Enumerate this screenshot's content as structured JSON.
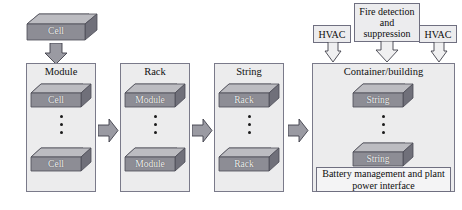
{
  "diagram": {
    "colors": {
      "panel_fill": "#ececed",
      "panel_stroke": "#7a7a8a",
      "block_top": "#b9b9bd",
      "block_front": "#8b8b93",
      "block_side": "#6e6e77",
      "arrow_fill": "#9a9aa2",
      "arrow_stroke": "#4a4a55",
      "text": "#111111",
      "block_text": "#f2f2f2"
    },
    "source_block": {
      "label": "Cell"
    },
    "stages": [
      {
        "key": "module",
        "title": "Module",
        "top_block": "Cell",
        "bottom_block": "Cell",
        "ellipsis_dots": 3
      },
      {
        "key": "rack",
        "title": "Rack",
        "top_block": "Module",
        "bottom_block": "Module",
        "ellipsis_dots": 3
      },
      {
        "key": "string",
        "title": "String",
        "top_block": "Rack",
        "bottom_block": "Rack",
        "ellipsis_dots": 3
      },
      {
        "key": "container",
        "title": "Container/building",
        "top_block": "String",
        "bottom_block": "String",
        "ellipsis_dots": 3,
        "footer": "Battery management and plant power interface"
      }
    ],
    "auxiliary": {
      "fire": "Fire detection and suppression",
      "hvac_left": "HVAC",
      "hvac_right": "HVAC"
    },
    "flow_arrows": [
      {
        "from": "module",
        "to": "rack"
      },
      {
        "from": "rack",
        "to": "string"
      },
      {
        "from": "string",
        "to": "container"
      }
    ]
  }
}
